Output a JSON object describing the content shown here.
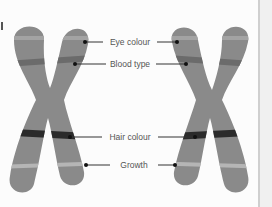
{
  "diagram": {
    "title": "",
    "colors": {
      "chromosome": "#8a8a8a",
      "band_light": "#a3a3a3",
      "band_mid": "#6b6b6b",
      "band_dark": "#2b2b2b",
      "band_pale": "#b5b5b5",
      "leader": "#333333",
      "text": "#555555"
    },
    "labels": [
      {
        "id": "eye",
        "text": "Eye colour",
        "y": 42
      },
      {
        "id": "blood",
        "text": "Blood type",
        "y": 64
      },
      {
        "id": "hair",
        "text": "Hair colour",
        "y": 137
      },
      {
        "id": "growth",
        "text": "Growth",
        "y": 165
      }
    ],
    "chromosomes": [
      {
        "id": "left-chromosome"
      },
      {
        "id": "right-chromosome"
      }
    ]
  }
}
